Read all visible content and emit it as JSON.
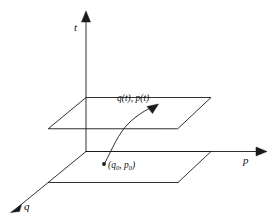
{
  "figure": {
    "type": "diagram",
    "background_color": "#ffffff",
    "line_color": "#1a1a1a"
  },
  "axes": {
    "vertical": {
      "name": "t-axis",
      "label": "t",
      "direction": "up",
      "arrow": true
    },
    "right": {
      "name": "p-axis",
      "label": "p",
      "direction": "right",
      "arrow": true
    },
    "depth": {
      "name": "q-axis",
      "label": "q",
      "direction": "down-left",
      "arrow": true
    }
  },
  "planes": [
    {
      "name": "upper-plane",
      "role": "phase plane at time t",
      "shape": "parallelogram"
    },
    {
      "name": "lower-plane",
      "role": "phase plane at initial time",
      "shape": "parallelogram"
    }
  ],
  "trajectory": {
    "name": "trajectory-curve",
    "arrow": true,
    "start_point_marker": "dot",
    "end_label": "q(t), p(t)",
    "start_label_prefix": "(",
    "start_label_q": "q",
    "start_label_q_sub": "0",
    "start_label_mid": ", ",
    "start_label_p": "p",
    "start_label_p_sub": "0",
    "start_label_suffix": ")"
  },
  "labels": {
    "time_axis": "t",
    "momentum_axis": "p",
    "position_axis": "q",
    "trajectory_point": "q(t), p(t)"
  }
}
